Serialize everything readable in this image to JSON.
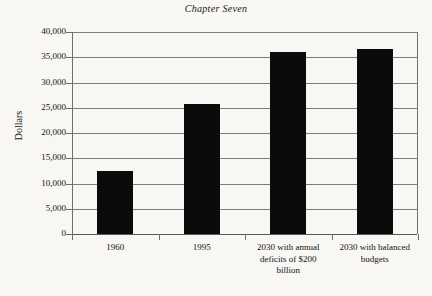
{
  "page": {
    "running_head": "Chapter Seven"
  },
  "chart_data": {
    "type": "bar",
    "title": "",
    "xlabel": "",
    "ylabel": "Dollars",
    "ylim": [
      0,
      40000
    ],
    "grid": true,
    "legend": false,
    "categories": [
      "1960",
      "1995",
      "2030 with annual deficits of $200 billion",
      "2030 with balanced budgets"
    ],
    "category_label_lines": [
      [
        "1960"
      ],
      [
        "1995"
      ],
      [
        "2030 with annual",
        "deficits of $200",
        "billion"
      ],
      [
        "2030 with balanced",
        "budgets"
      ]
    ],
    "values": [
      12500,
      25700,
      36000,
      36700
    ],
    "ytick_labels": [
      "40,000",
      "35,000",
      "30,000",
      "25,000",
      "20,000",
      "15,000",
      "10,000",
      "5,000",
      "0"
    ],
    "ytick_values": [
      40000,
      35000,
      30000,
      25000,
      20000,
      15000,
      10000,
      5000,
      0
    ],
    "bar_color": "#0b0b0b",
    "grid_color": "#7c7c7c",
    "axis_color": "#6f6f6f",
    "background_color": "#f8f7f4"
  }
}
